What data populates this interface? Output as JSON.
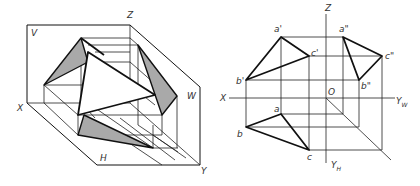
{
  "figure": {
    "left": {
      "title": "Axonometric view of triangle ABC projected onto three planes",
      "plane_labels": {
        "V": "V",
        "W": "W",
        "H": "H"
      },
      "axis_labels": {
        "X": "X",
        "Y": "Y",
        "Z": "Z"
      }
    },
    "right": {
      "title": "Three-view orthographic projection of triangle ABC",
      "axis_labels": {
        "X": "X",
        "Z": "Z",
        "O": "O",
        "Y_W_main": "Y",
        "Y_W_sub": "W",
        "Y_H_main": "Y",
        "Y_H_sub": "H"
      },
      "front_view": {
        "a": "a'",
        "b": "b'",
        "c": "c'"
      },
      "side_view": {
        "a": "a\"",
        "b": "b\"",
        "c": "c\""
      },
      "top_view": {
        "a": "a",
        "b": "b",
        "c": "c"
      }
    }
  },
  "colors": {
    "line": "#111111",
    "shade": "#a9a9a9",
    "background": "#ffffff",
    "label": "#333333"
  }
}
